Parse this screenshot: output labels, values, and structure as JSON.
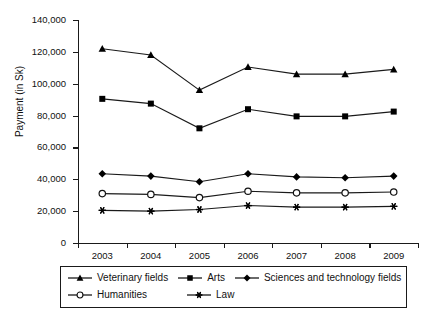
{
  "chart_data": {
    "type": "line",
    "title": "",
    "xlabel": "",
    "ylabel": "Payment (in Sk)",
    "categories": [
      "2003",
      "2004",
      "2005",
      "2006",
      "2007",
      "2008",
      "2009"
    ],
    "ylim": [
      0,
      140000
    ],
    "ytick_labels": [
      "0",
      "20,000",
      "40,000",
      "60,000",
      "80,000",
      "100,000",
      "120,000",
      "140,000"
    ],
    "ytick_values": [
      0,
      20000,
      40000,
      60000,
      80000,
      100000,
      120000,
      140000
    ],
    "grid": false,
    "legend_position": "bottom",
    "series": [
      {
        "name": "Veterinary fields",
        "marker": "triangle",
        "values": [
          122000,
          118000,
          96000,
          110500,
          106000,
          106000,
          109000
        ]
      },
      {
        "name": "Arts",
        "marker": "square",
        "values": [
          90500,
          87500,
          72000,
          84000,
          79500,
          79500,
          82500
        ]
      },
      {
        "name": "Sciences and technology fields",
        "marker": "diamond",
        "values": [
          43500,
          42000,
          38500,
          43500,
          41500,
          41000,
          42000
        ]
      },
      {
        "name": "Humanities",
        "marker": "open-circle",
        "values": [
          31000,
          30500,
          28500,
          32500,
          31500,
          31500,
          32000
        ]
      },
      {
        "name": "Law",
        "marker": "asterisk",
        "values": [
          20500,
          20000,
          21000,
          23500,
          22500,
          22500,
          23000
        ]
      }
    ]
  },
  "style": {
    "line_color": "#1a1a1a",
    "marker_color": "#000000",
    "background": "#ffffff"
  }
}
